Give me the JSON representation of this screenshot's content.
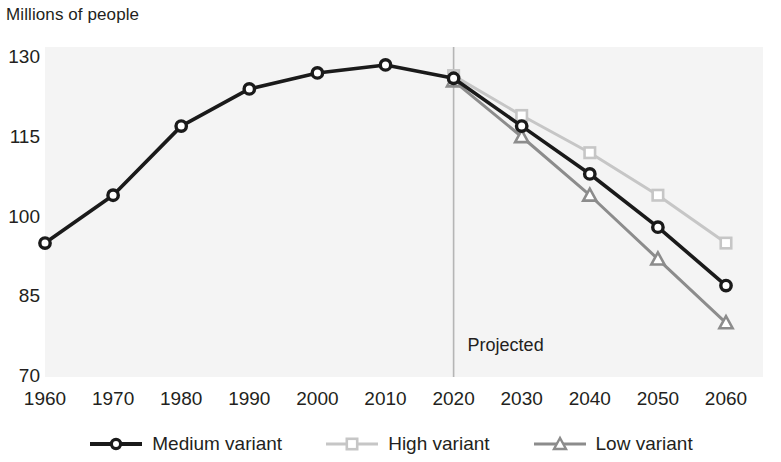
{
  "chart_data": {
    "type": "line",
    "title": "",
    "ylabel": "Millions of people",
    "xlabel": "",
    "categories": [
      1960,
      1970,
      1980,
      1990,
      2000,
      2010,
      2020,
      2030,
      2040,
      2050,
      2060
    ],
    "xtick_labels": [
      "1960",
      "1970",
      "1980",
      "1990",
      "2000",
      "2010",
      "2020",
      "2030",
      "2040",
      "2050",
      "2060"
    ],
    "ytick_labels": [
      "130",
      "115",
      "100",
      "85",
      "70"
    ],
    "ytick_values": [
      130,
      115,
      100,
      85,
      70
    ],
    "ylim": [
      70,
      130
    ],
    "xlim": [
      1960,
      2060
    ],
    "grid": false,
    "legend_position": "bottom",
    "annotations": [
      {
        "text": "Projected",
        "x": 2020,
        "y": 76,
        "type": "divider-label"
      }
    ],
    "divider": {
      "x": 2020,
      "label": "Projected"
    },
    "series": [
      {
        "name": "Medium variant",
        "marker": "circle",
        "color": "#1a1a1a",
        "x": [
          1960,
          1970,
          1980,
          1990,
          2000,
          2010,
          2020,
          2030,
          2040,
          2050,
          2060
        ],
        "values": [
          95.0,
          104.0,
          117.0,
          124.0,
          127.0,
          128.5,
          126.0,
          117.0,
          108.0,
          98.0,
          87.0
        ]
      },
      {
        "name": "High variant",
        "marker": "square",
        "color": "#c6c6c6",
        "x": [
          2020,
          2030,
          2040,
          2050,
          2060
        ],
        "values": [
          126.5,
          119.0,
          112.0,
          104.0,
          95.0
        ]
      },
      {
        "name": "Low variant",
        "marker": "triangle",
        "color": "#8c8c8c",
        "x": [
          2020,
          2030,
          2040,
          2050,
          2060
        ],
        "values": [
          125.5,
          115.0,
          104.0,
          92.0,
          80.0
        ]
      }
    ]
  },
  "legend": {
    "items": [
      {
        "label": "Medium variant",
        "marker": "circle",
        "color": "#1a1a1a"
      },
      {
        "label": "High variant",
        "marker": "square",
        "color": "#c6c6c6"
      },
      {
        "label": "Low variant",
        "marker": "triangle",
        "color": "#8c8c8c"
      }
    ]
  },
  "colors": {
    "medium": "#1a1a1a",
    "high": "#c6c6c6",
    "low": "#8c8c8c",
    "plot_background": "#f4f4f4",
    "text": "#231f20",
    "divider": "#b5b5b5"
  }
}
